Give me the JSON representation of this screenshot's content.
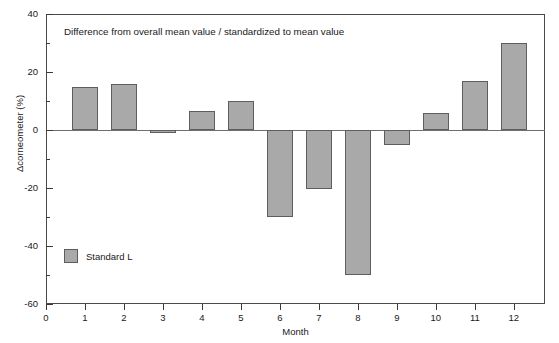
{
  "chart_data": {
    "type": "bar",
    "title": "",
    "annotation": "Difference from overall mean value / standardized to mean value",
    "xlabel": "Month",
    "ylabel": "Δcorneometer (%)",
    "categories": [
      "1",
      "2",
      "3",
      "4",
      "5",
      "6",
      "7",
      "8",
      "9",
      "10",
      "11",
      "12"
    ],
    "values": [
      15,
      16,
      -1,
      6.5,
      10,
      -30,
      -20.5,
      -50,
      -5,
      6,
      17,
      30
    ],
    "series": [
      {
        "name": "Standard L",
        "color": "#a9a9a9",
        "values": [
          15,
          16,
          -1,
          6.5,
          10,
          -30,
          -20.5,
          -50,
          -5,
          6,
          17,
          30
        ]
      }
    ],
    "ylim": [
      -60,
      40
    ],
    "xlim": [
      0,
      12.8
    ],
    "y_major_ticks": [
      40,
      20,
      0,
      -20,
      -40,
      -60
    ],
    "y_minor_ticks": [
      30,
      10,
      -10,
      -30,
      -50
    ],
    "x_ticks": [
      0,
      1,
      2,
      3,
      4,
      5,
      6,
      7,
      8,
      9,
      10,
      11,
      12
    ],
    "grid": false,
    "legend_position": "inside-bottom-left",
    "legend": [
      {
        "label": "Standard L",
        "color": "#a9a9a9"
      }
    ]
  },
  "axes": {
    "y_tick_labels": [
      "40",
      "20",
      "0",
      "-20",
      "-40",
      "-60"
    ],
    "x_tick_labels": [
      "0",
      "1",
      "2",
      "3",
      "4",
      "5",
      "6",
      "7",
      "8",
      "9",
      "10",
      "11",
      "12"
    ],
    "x_title": "Month",
    "y_title": "Δcorneometer (%)"
  },
  "annotation": {
    "text": "Difference from overall mean value / standardized to mean value"
  },
  "legend": {
    "items": [
      {
        "label": "Standard L"
      }
    ]
  },
  "colors": {
    "bar_fill": "#a9a9a9",
    "bar_stroke": "#5e5e5e",
    "axis": "#4a4a4a",
    "text": "#1a1a1a"
  }
}
